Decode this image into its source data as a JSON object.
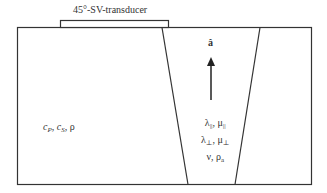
{
  "diagram": {
    "transducer_label": "45°-SV-transducer",
    "outer_medium_label": "c_P, c_S, ρ",
    "outer_medium_parts": {
      "c": "c",
      "p": "P",
      "s": "S",
      "rho": "ρ"
    },
    "unit_vector_label": "â",
    "wedge_properties": {
      "line1": {
        "lambda": "λ",
        "lambda_sub": "||",
        "mu": "μ",
        "mu_sub": "||"
      },
      "line2": {
        "lambda": "λ",
        "lambda_sub": "⊥",
        "mu": "μ",
        "mu_sub": "⊥"
      },
      "line3": {
        "nu": "ν",
        "rho": "ρ",
        "rho_sub": "a"
      }
    },
    "colors": {
      "line": "#333333",
      "background": "#ffffff"
    }
  }
}
